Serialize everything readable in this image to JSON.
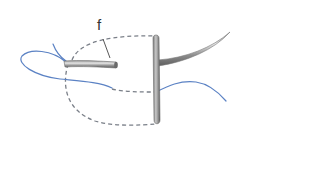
{
  "diagram": {
    "type": "surgical-suture-illustration",
    "labels": [
      {
        "id": "f",
        "text": "f",
        "x": 97,
        "y": 17
      }
    ],
    "colors": {
      "suture": "#5b82c4",
      "dashed_path": "#7a7f88",
      "needle_dark": "#6f6f6f",
      "needle_light": "#d8d8d8",
      "label": "#333333",
      "background": "#ffffff"
    },
    "elements": [
      {
        "name": "short-needle",
        "description": "Short horizontal needle segment on the left"
      },
      {
        "name": "vertical-bar",
        "description": "Vertical rod / bolster"
      },
      {
        "name": "curved-needle",
        "description": "Curved needle exiting right, sweeping upward"
      },
      {
        "name": "suture-thread",
        "description": "Blue thread looping left and passing through rod"
      },
      {
        "name": "dashed-path",
        "description": "Dashed loop indicating hidden needle path"
      },
      {
        "name": "leader-line",
        "description": "Leader line from label f to the dashed path"
      }
    ]
  }
}
